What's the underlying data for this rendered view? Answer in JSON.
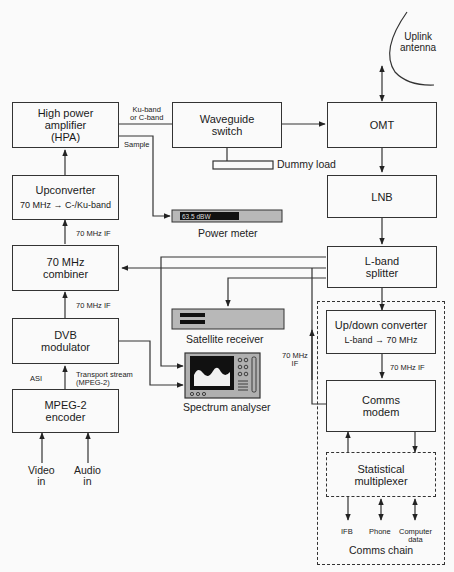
{
  "diagram": {
    "blocks": {
      "hpa": "High power\namplifier\n(HPA)",
      "waveguide_switch": "Waveguide\nswitch",
      "omt": "OMT",
      "lnb": "LNB",
      "lband_splitter": "L-band\nsplitter",
      "upconverter": "Upconverter",
      "upconverter_sub": "70 MHz → C-/Ku-band",
      "combiner": "70 MHz\ncombiner",
      "dvb_modulator": "DVB\nmodulator",
      "mpeg2_encoder": "MPEG-2\nencoder",
      "updown_converter": "Up/down converter",
      "updown_converter_sub": "L-band → 70 MHz",
      "comms_modem": "Comms\nmodem",
      "stat_mux": "Statistical\nmultiplexer"
    },
    "devices": {
      "power_meter": "Power meter",
      "power_meter_reading": "63.5 dBW",
      "satellite_receiver": "Satellite receiver",
      "spectrum_analyser": "Spectrum analyser",
      "uplink_antenna": "Uplink\nantenna",
      "dummy_load": "Dummy load"
    },
    "labels": {
      "ku_or_c_band": "Ku-band\nor C-band",
      "sample": "Sample",
      "if_upconverter": "70 MHz IF",
      "if_combiner": "70 MHz IF",
      "asi": "ASI",
      "transport_stream": "Transport stream\n(MPEG-2)",
      "if_return": "70 MHz\nIF",
      "if_modem": "70 MHz IF",
      "ifb": "IFB",
      "phone": "Phone",
      "computer_data": "Computer\ndata",
      "video_in": "Video\nin",
      "audio_in": "Audio\nin",
      "comms_chain": "Comms chain"
    }
  }
}
